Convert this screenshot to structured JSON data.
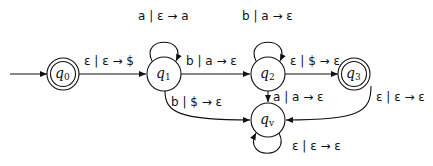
{
  "diagram": {
    "type": "pushdown-automaton",
    "states": [
      {
        "id": "q0",
        "name": "q",
        "sub": "0",
        "accepting": true,
        "start": true
      },
      {
        "id": "q1",
        "name": "q",
        "sub": "1",
        "accepting": false
      },
      {
        "id": "q2",
        "name": "q",
        "sub": "2",
        "accepting": false
      },
      {
        "id": "q3",
        "name": "q",
        "sub": "3",
        "accepting": true
      },
      {
        "id": "qv",
        "name": "q",
        "sub": "v",
        "accepting": false
      }
    ],
    "transitions": [
      {
        "from": "q0",
        "to": "q1",
        "label": "ε | ε → $"
      },
      {
        "from": "q1",
        "to": "q1",
        "label": "a | ε → a"
      },
      {
        "from": "q1",
        "to": "q2",
        "label": "b | a → ε"
      },
      {
        "from": "q2",
        "to": "q2",
        "label": "b | a → ε"
      },
      {
        "from": "q2",
        "to": "q3",
        "label": "ε | $ → ε"
      },
      {
        "from": "q1",
        "to": "qv",
        "label": "b | $ → ε"
      },
      {
        "from": "q2",
        "to": "qv",
        "label": "a | a → ε"
      },
      {
        "from": "q3",
        "to": "qv",
        "label": "ε | ε → ε"
      },
      {
        "from": "qv",
        "to": "qv",
        "label": "ε | ε → ε"
      }
    ]
  }
}
